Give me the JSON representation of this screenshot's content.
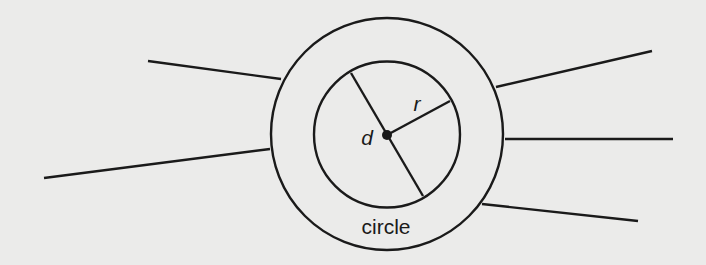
{
  "diagram": {
    "background": "#ebebea",
    "ink": "#1a1a1a",
    "outer_circle": {
      "cx": 387,
      "cy": 134,
      "r": 116
    },
    "inner_circle": {
      "cx": 387,
      "cy": 134.5,
      "r": 73
    },
    "center_dot": {
      "cx": 387,
      "cy": 135,
      "r": 5
    },
    "diameter": {
      "x1": 351,
      "y1": 73,
      "x2": 423,
      "y2": 196
    },
    "radius": {
      "x1": 387,
      "y1": 135,
      "x2": 450,
      "y2": 101
    },
    "rays": [
      {
        "x1": 148,
        "y1": 61,
        "x2": 281,
        "y2": 79
      },
      {
        "x1": 44,
        "y1": 178,
        "x2": 270,
        "y2": 149
      },
      {
        "x1": 496,
        "y1": 87,
        "x2": 652,
        "y2": 51
      },
      {
        "x1": 505,
        "y1": 139,
        "x2": 673,
        "y2": 139
      },
      {
        "x1": 482,
        "y1": 204,
        "x2": 638,
        "y2": 221
      }
    ],
    "labels": {
      "diameter": "d",
      "radius": "r",
      "shape": "circle"
    }
  }
}
